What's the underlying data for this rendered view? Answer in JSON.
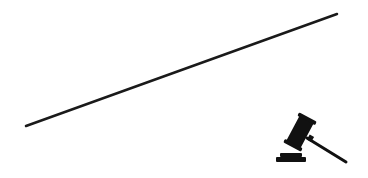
{
  "figure": {
    "background": "#ffffff",
    "line": {
      "color": "#1a1a1a",
      "from": [
        26,
        126
      ],
      "to": [
        337,
        14
      ],
      "width": 2.5
    },
    "icon": {
      "name": "gavel-icon",
      "color": "#111111"
    }
  }
}
